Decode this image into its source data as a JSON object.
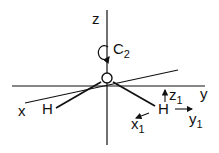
{
  "diagram": {
    "type": "molecular-coordinate-system",
    "axes": {
      "x": "x",
      "y": "y",
      "z": "z"
    },
    "symmetry": {
      "label": "C",
      "subscript": "2"
    },
    "atoms": {
      "center": "O",
      "left": "H",
      "right": "H"
    },
    "local_axes": {
      "x1": {
        "label": "x",
        "subscript": "1"
      },
      "y1": {
        "label": "y",
        "subscript": "1"
      },
      "z1": {
        "label": "z",
        "subscript": "1"
      }
    },
    "stroke_color": "#111111"
  }
}
